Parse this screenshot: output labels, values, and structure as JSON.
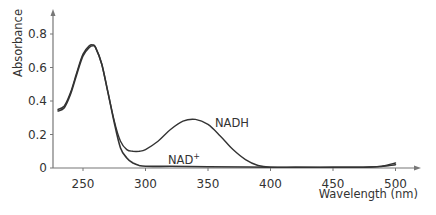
{
  "chart_data": {
    "type": "line",
    "title": "",
    "xlabel": "Wavelength (nm)",
    "ylabel": "Absorbance",
    "xlim": [
      230,
      510
    ],
    "ylim": [
      0,
      0.9
    ],
    "grid": false,
    "x_ticks": [
      250,
      300,
      350,
      400,
      450,
      500
    ],
    "y_ticks": [
      0,
      0.2,
      0.4,
      0.6,
      0.8
    ],
    "y_tick_labels": [
      "0",
      "0.2",
      "0.4",
      "0.6",
      "0.8"
    ],
    "series": [
      {
        "name": "NADH",
        "x": [
          230,
          235,
          240,
          245,
          250,
          255,
          258,
          260,
          265,
          270,
          275,
          280,
          285,
          290,
          295,
          300,
          310,
          320,
          330,
          340,
          350,
          360,
          370,
          380,
          390,
          400,
          420,
          450,
          480,
          490,
          500
        ],
        "values": [
          0.35,
          0.37,
          0.45,
          0.57,
          0.68,
          0.73,
          0.735,
          0.72,
          0.62,
          0.45,
          0.28,
          0.16,
          0.11,
          0.1,
          0.1,
          0.11,
          0.16,
          0.23,
          0.28,
          0.29,
          0.26,
          0.19,
          0.11,
          0.05,
          0.015,
          0.005,
          0.004,
          0.004,
          0.006,
          0.012,
          0.03
        ]
      },
      {
        "name": "NAD+",
        "x": [
          230,
          235,
          240,
          245,
          250,
          255,
          258,
          260,
          265,
          270,
          275,
          280,
          285,
          290,
          295,
          300,
          320,
          350,
          400,
          450,
          480,
          490,
          500
        ],
        "values": [
          0.34,
          0.36,
          0.44,
          0.56,
          0.67,
          0.72,
          0.73,
          0.72,
          0.62,
          0.45,
          0.27,
          0.12,
          0.06,
          0.03,
          0.015,
          0.01,
          0.01,
          0.008,
          0.005,
          0.004,
          0.006,
          0.01,
          0.02
        ]
      }
    ],
    "annotations": [
      {
        "text": "NADH",
        "x": 350,
        "y": 0.27
      },
      {
        "text": "NAD",
        "superscript": "+",
        "x": 320,
        "y": 0.03
      }
    ],
    "legend": "inline labels"
  },
  "labels": {
    "ylabel": "Absorbance",
    "xlabel": "Wavelength (nm)",
    "nadh": "NADH",
    "nad": "NAD",
    "nad_sup": "+"
  }
}
